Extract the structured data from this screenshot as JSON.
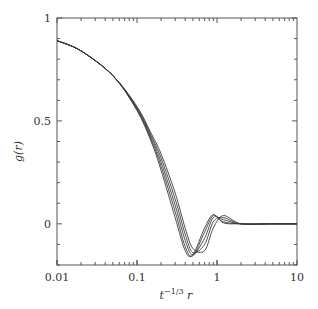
{
  "chart_data": {
    "type": "line",
    "title": "",
    "xlabel": "t^{-1/3} r",
    "xlabel_display": {
      "base": "t",
      "sup": "−1/3",
      "tail": " r"
    },
    "ylabel": "g(r)",
    "xscale": "log",
    "xlim": [
      0.01,
      10
    ],
    "ylim": [
      -0.2,
      1.0
    ],
    "grid": false,
    "legend": null,
    "x_ticks": [
      0.01,
      0.1,
      1,
      10
    ],
    "x_tick_labels": [
      "0.01",
      "0.1",
      "1",
      "10"
    ],
    "y_ticks": [
      0,
      0.5,
      1
    ],
    "y_tick_labels": [
      "0",
      "0.5",
      "1"
    ],
    "y_minor_step": 0.1,
    "series": [
      {
        "name": "curve-1",
        "x": [
          0.01,
          0.02,
          0.05,
          0.1,
          0.15,
          0.2,
          0.3,
          0.4,
          0.5,
          0.7,
          0.9,
          1.2,
          2,
          5,
          10
        ],
        "y": [
          0.89,
          0.84,
          0.72,
          0.55,
          0.4,
          0.26,
          0.03,
          -0.13,
          -0.15,
          -0.02,
          0.045,
          0.005,
          0.0,
          0.0,
          0.0
        ]
      },
      {
        "name": "curve-2",
        "x": [
          0.01,
          0.02,
          0.05,
          0.1,
          0.15,
          0.2,
          0.3,
          0.4,
          0.5,
          0.7,
          0.9,
          1.2,
          2,
          5,
          10
        ],
        "y": [
          0.89,
          0.84,
          0.72,
          0.555,
          0.41,
          0.28,
          0.06,
          -0.11,
          -0.155,
          -0.04,
          0.04,
          0.01,
          0.0,
          0.0,
          0.0
        ]
      },
      {
        "name": "curve-3",
        "x": [
          0.01,
          0.02,
          0.05,
          0.1,
          0.15,
          0.2,
          0.3,
          0.4,
          0.5,
          0.7,
          0.9,
          1.2,
          2,
          5,
          10
        ],
        "y": [
          0.89,
          0.84,
          0.72,
          0.56,
          0.42,
          0.3,
          0.09,
          -0.08,
          -0.15,
          -0.07,
          0.03,
          0.02,
          0.0,
          0.0,
          0.0
        ]
      },
      {
        "name": "curve-4",
        "x": [
          0.01,
          0.02,
          0.05,
          0.1,
          0.15,
          0.2,
          0.3,
          0.4,
          0.5,
          0.7,
          0.9,
          1.2,
          2,
          5,
          10
        ],
        "y": [
          0.89,
          0.84,
          0.72,
          0.565,
          0.43,
          0.32,
          0.12,
          -0.05,
          -0.14,
          -0.1,
          0.01,
          0.03,
          0.0,
          0.0,
          0.0
        ]
      },
      {
        "name": "curve-5",
        "x": [
          0.01,
          0.02,
          0.05,
          0.1,
          0.15,
          0.2,
          0.3,
          0.4,
          0.5,
          0.7,
          0.9,
          1.2,
          2,
          5,
          10
        ],
        "y": [
          0.89,
          0.84,
          0.72,
          0.57,
          0.44,
          0.34,
          0.15,
          -0.02,
          -0.12,
          -0.13,
          -0.02,
          0.04,
          0.0,
          0.0,
          0.0
        ]
      }
    ],
    "line_color": "#3a3a3a",
    "axis_color": "#555555"
  }
}
